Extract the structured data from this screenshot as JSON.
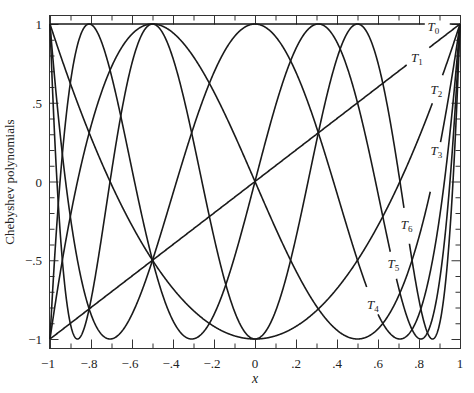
{
  "chart_data": {
    "type": "line",
    "title": "",
    "xlabel": "x",
    "ylabel": "Chebyshev polynomials",
    "xlim": [
      -1,
      1
    ],
    "ylim": [
      -1,
      1
    ],
    "grid": false,
    "legend": "inline labels",
    "x_ticks": [
      {
        "value": -1,
        "label": "−1"
      },
      {
        "value": -0.8,
        "label": "−.8"
      },
      {
        "value": -0.6,
        "label": "−.6"
      },
      {
        "value": -0.4,
        "label": "−.4"
      },
      {
        "value": -0.2,
        "label": "−.2"
      },
      {
        "value": 0,
        "label": "0"
      },
      {
        "value": 0.2,
        "label": ".2"
      },
      {
        "value": 0.4,
        "label": ".4"
      },
      {
        "value": 0.6,
        "label": ".6"
      },
      {
        "value": 0.8,
        "label": ".8"
      },
      {
        "value": 1,
        "label": "1"
      }
    ],
    "y_ticks": [
      {
        "value": 1,
        "label": "1"
      },
      {
        "value": 0.5,
        "label": ".5"
      },
      {
        "value": 0,
        "label": "0"
      },
      {
        "value": -0.5,
        "label": "−.5"
      },
      {
        "value": -1,
        "label": "−1"
      }
    ],
    "series": [
      {
        "name": "T0",
        "degree": 0,
        "formula": "1",
        "label": {
          "text": "T",
          "sub": "0",
          "x": 0.87,
          "y": 0.985
        },
        "gap": [
          0.83,
          0.95
        ]
      },
      {
        "name": "T1",
        "degree": 1,
        "formula": "x",
        "label": {
          "text": "T",
          "sub": "1",
          "x": 0.79,
          "y": 0.79
        },
        "gap": [
          0.74,
          0.85
        ]
      },
      {
        "name": "T2",
        "degree": 2,
        "formula": "2x^2-1",
        "label": {
          "text": "T",
          "sub": "2",
          "x": 0.885,
          "y": 0.585
        },
        "gap": [
          0.865,
          0.915
        ]
      },
      {
        "name": "T3",
        "degree": 3,
        "formula": "4x^3-3x",
        "label": {
          "text": "T",
          "sub": "3",
          "x": 0.885,
          "y": 0.2
        },
        "gap": [
          0.855,
          0.905
        ]
      },
      {
        "name": "T4",
        "degree": 4,
        "formula": "8x^4-8x^2+1",
        "label": {
          "text": "T",
          "sub": "4",
          "x": 0.575,
          "y": -0.78
        },
        "gap": [
          0.545,
          0.6
        ]
      },
      {
        "name": "T5",
        "degree": 5,
        "formula": "16x^5-20x^3+5x",
        "label": {
          "text": "T",
          "sub": "5",
          "x": 0.675,
          "y": -0.52
        },
        "gap": [
          0.66,
          0.69
        ]
      },
      {
        "name": "T6",
        "degree": 6,
        "formula": "32x^6-48x^4+18x^2-1",
        "label": {
          "text": "T",
          "sub": "6",
          "x": 0.74,
          "y": -0.27
        },
        "gap": [
          0.728,
          0.752
        ]
      }
    ],
    "sample_points": {
      "x": [
        -1,
        -0.5,
        0,
        0.5,
        1
      ],
      "T0": [
        1,
        1,
        1,
        1,
        1
      ],
      "T1": [
        -1,
        -0.5,
        0,
        0.5,
        1
      ],
      "T2": [
        1,
        -0.5,
        -1,
        -0.5,
        1
      ],
      "T3": [
        -1,
        1,
        0,
        -1,
        1
      ],
      "T4": [
        1,
        -0.5,
        1,
        -0.5,
        1
      ],
      "T5": [
        -1,
        -0.5,
        0,
        0.5,
        1
      ],
      "T6": [
        1,
        1,
        -1,
        1,
        1
      ]
    }
  },
  "colors": {
    "line": "#1a1a1a",
    "frame": "#333333",
    "background": "#ffffff"
  }
}
